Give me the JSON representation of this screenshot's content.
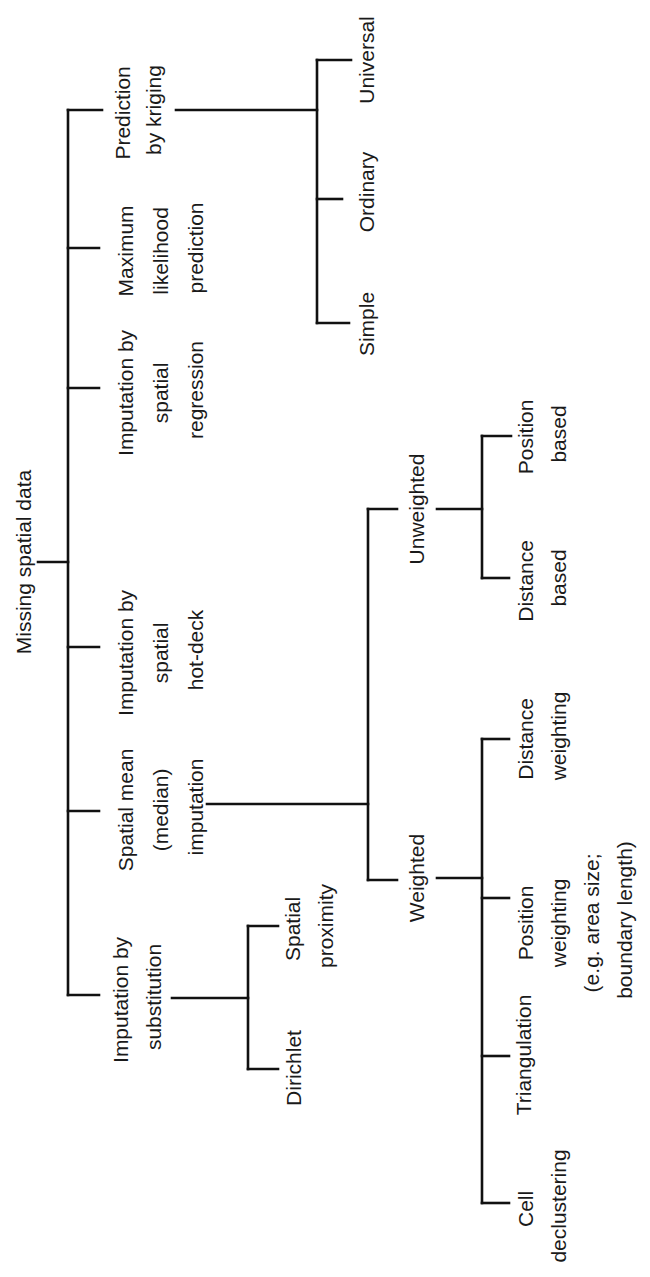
{
  "diagram": {
    "orientation": "rotated-90-ccw",
    "colors": {
      "line": "#111111",
      "text": "#1a1a1a",
      "background": "#ffffff"
    },
    "root": {
      "label": "Missing spatial data"
    },
    "level1": [
      {
        "id": "kriging",
        "lines": [
          "Prediction",
          "by kriging"
        ]
      },
      {
        "id": "maxlik",
        "lines": [
          "Maximum",
          "likelihood",
          "prediction"
        ]
      },
      {
        "id": "regression",
        "lines": [
          "Imputation by",
          "spatial",
          "regression"
        ]
      },
      {
        "id": "hotdeck",
        "lines": [
          "Imputation by",
          "spatial",
          "hot-deck"
        ]
      },
      {
        "id": "mean",
        "lines": [
          "Spatial mean",
          "(median)",
          "imputation"
        ]
      },
      {
        "id": "substitution",
        "lines": [
          "Imputation by",
          "substitution"
        ]
      }
    ],
    "kriging_children": [
      {
        "lines": [
          "Universal"
        ]
      },
      {
        "lines": [
          "Ordinary"
        ]
      },
      {
        "lines": [
          "Simple"
        ]
      }
    ],
    "substitution_children": [
      {
        "lines": [
          "Spatial",
          "proximity"
        ]
      },
      {
        "lines": [
          "Dirichlet"
        ]
      }
    ],
    "mean_children": [
      {
        "id": "unweighted",
        "lines": [
          "Unweighted"
        ]
      },
      {
        "id": "weighted",
        "lines": [
          "Weighted"
        ]
      }
    ],
    "unweighted_children": [
      {
        "lines": [
          "Position",
          "based"
        ]
      },
      {
        "lines": [
          "Distance",
          "based"
        ]
      }
    ],
    "weighted_children": [
      {
        "lines": [
          "Distance",
          "weighting"
        ]
      },
      {
        "lines": [
          "Position",
          "weighting",
          "(e.g. area size;",
          "boundary length)"
        ]
      },
      {
        "lines": [
          "Triangulation"
        ]
      },
      {
        "lines": [
          "Cell",
          "declustering"
        ]
      }
    ]
  }
}
